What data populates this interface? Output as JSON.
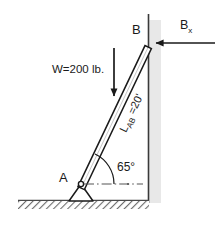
{
  "figure": {
    "background_color": "#ffffff",
    "labels": {
      "point_a": "A",
      "point_b": "B",
      "weight": "W=200 lb.",
      "angle": "65°",
      "length_main": "L",
      "length_sub": "AB",
      "length_value": " =20'",
      "reaction_main": "B",
      "reaction_sub": "x"
    },
    "geometry": {
      "beam_start_x": 81,
      "beam_start_y": 184,
      "beam_end_x": 148,
      "beam_end_y": 43,
      "beam_angle_deg": 65,
      "wall_x": 148,
      "ground_y": 200,
      "weight_arrow_x": 114,
      "weight_arrow_top_y": 48,
      "weight_arrow_tip_y": 101,
      "force_arrow_tail_x": 215,
      "force_arrow_tip_x": 151,
      "force_arrow_y": 43
    },
    "colors": {
      "stroke": "#1a1a1a",
      "beam_fill": "#ffffff",
      "wall_shade": "#e8e8e8",
      "hatch": "#6e6e6e",
      "reference_line": "#555555"
    }
  }
}
